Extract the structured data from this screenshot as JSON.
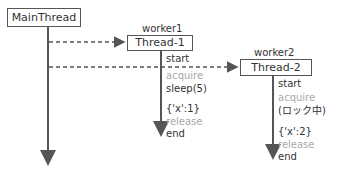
{
  "main": {
    "label": "MainThread"
  },
  "worker1": {
    "name": "worker1",
    "thread": "Thread-1",
    "events": [
      "start",
      "acquire",
      "sleep(5)",
      "{'x':1}",
      "release",
      "end"
    ]
  },
  "worker2": {
    "name": "worker2",
    "thread": "Thread-2",
    "events": [
      "start",
      "acquire",
      "(ロック中)",
      "{'x':2}",
      "release",
      "end"
    ]
  },
  "colors": {
    "line": "#555555",
    "muted": "#aaaaaa",
    "text": "#333333"
  }
}
